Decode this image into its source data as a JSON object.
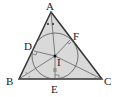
{
  "diagram": {
    "labels": {
      "A": "A",
      "B": "B",
      "C": "C",
      "D": "D",
      "E": "E",
      "F": "F",
      "I": "I"
    },
    "colors": {
      "fill": "#d9d9d9",
      "stroke": "#333333"
    }
  }
}
